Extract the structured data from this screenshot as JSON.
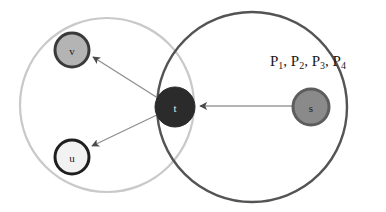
{
  "figure": {
    "background_color": "#ffffff",
    "width": 386,
    "height": 212
  },
  "sets": [
    {
      "id": "left-set",
      "name": "left-region-circle",
      "cx": 107,
      "cy": 105,
      "r": 87,
      "stroke_color": "#c9c9c9",
      "stroke_width": 2.2,
      "fill": "none"
    },
    {
      "id": "right-set",
      "name": "right-region-circle",
      "cx": 252,
      "cy": 107,
      "r": 95,
      "stroke_color": "#545454",
      "stroke_width": 2.4,
      "fill": "none"
    }
  ],
  "nodes": [
    {
      "id": "v",
      "label": "v",
      "cx": 72,
      "cy": 50,
      "r": 18,
      "fill_color": "#b4b4b4",
      "stroke_color": "#3a3a3a",
      "stroke_width": 3,
      "label_color": "#1a1a1a"
    },
    {
      "id": "u",
      "label": "u",
      "cx": 72,
      "cy": 157,
      "r": 18,
      "fill_color": "#f2f2f2",
      "stroke_color": "#1f1f1f",
      "stroke_width": 3,
      "label_color": "#1a1a1a"
    },
    {
      "id": "t",
      "label": "t",
      "cx": 175,
      "cy": 107,
      "r": 20,
      "fill_color": "#2b2b2b",
      "stroke_color": "#2b2b2b",
      "stroke_width": 1,
      "label_color": "#e8e8e8"
    },
    {
      "id": "s",
      "label": "s",
      "cx": 311,
      "cy": 107,
      "r": 19,
      "fill_color": "#8a8a8a",
      "stroke_color": "#5d5d5d",
      "stroke_width": 3,
      "label_color": "#1a1a1a"
    }
  ],
  "edges": [
    {
      "id": "s-to-t",
      "from": "s",
      "to": "t",
      "x1": 292,
      "y1": 106,
      "x2": 198,
      "y2": 106,
      "stroke_color": "#9a9a9a",
      "stroke_width": 1.2,
      "arrowhead_color": "#4a4a4a"
    },
    {
      "id": "t-to-v",
      "from": "t",
      "to": "v",
      "x1": 160,
      "y1": 100,
      "x2": 91,
      "y2": 56,
      "stroke_color": "#8e8e8e",
      "stroke_width": 1.2,
      "arrowhead_color": "#4a4a4a"
    },
    {
      "id": "t-to-u",
      "from": "t",
      "to": "u",
      "x1": 160,
      "y1": 113,
      "x2": 91,
      "y2": 146,
      "stroke_color": "#8e8e8e",
      "stroke_width": 1.2,
      "arrowhead_color": "#4a4a4a"
    }
  ],
  "annotations": [
    {
      "id": "path-set-label",
      "name": "path-set-label",
      "x": 270,
      "y": 62,
      "parts": [
        {
          "text": "P",
          "sub": "1"
        },
        {
          "text": ", P",
          "sub": "2"
        },
        {
          "text": ", P",
          "sub": "3"
        },
        {
          "text": ", P",
          "sub": "4"
        }
      ],
      "plain_text": "P1, P2, P3, P4",
      "color": "#1a1a1a",
      "font_size": 15
    }
  ]
}
